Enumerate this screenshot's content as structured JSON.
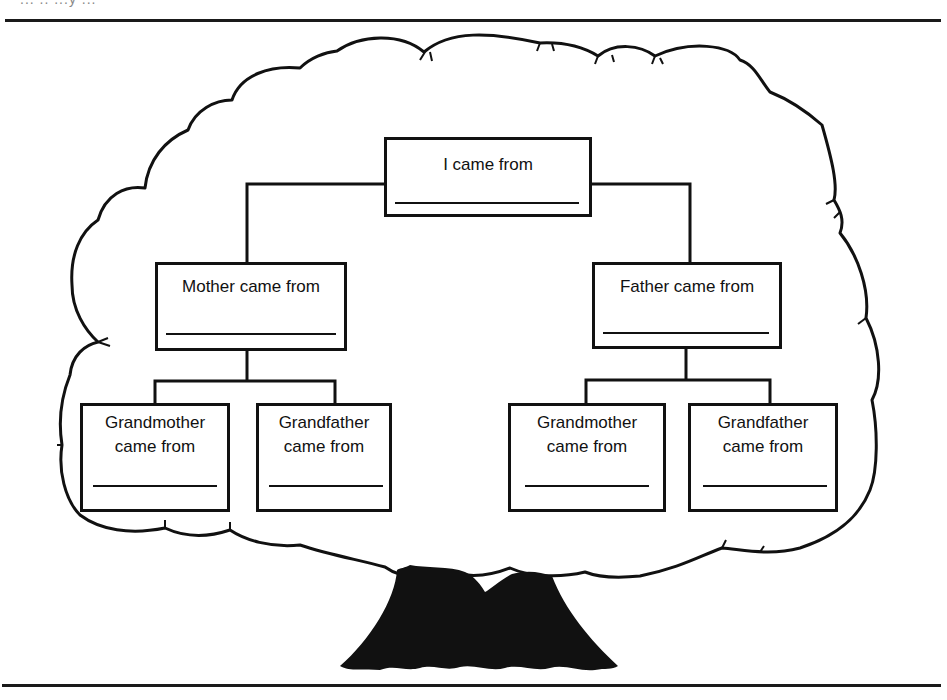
{
  "page": {
    "header_fragment": "...  ..  ...y ...",
    "colors": {
      "ink": "#111111",
      "paper": "#ffffff"
    }
  },
  "diagram": {
    "root": {
      "label": "I came from",
      "blank": ""
    },
    "parents": [
      {
        "label": "Mother came from",
        "blank": ""
      },
      {
        "label": "Father came from",
        "blank": ""
      }
    ],
    "grandparents": [
      {
        "line1": "Grandmother",
        "line2": "came from",
        "blank": ""
      },
      {
        "line1": "Grandfather",
        "line2": "came from",
        "blank": ""
      },
      {
        "line1": "Grandmother",
        "line2": "came from",
        "blank": ""
      },
      {
        "line1": "Grandfather",
        "line2": "came from",
        "blank": ""
      }
    ],
    "illustration": {
      "crown": "cloud-shaped tree crown outline",
      "trunk": "black tree trunk silhouette"
    }
  }
}
